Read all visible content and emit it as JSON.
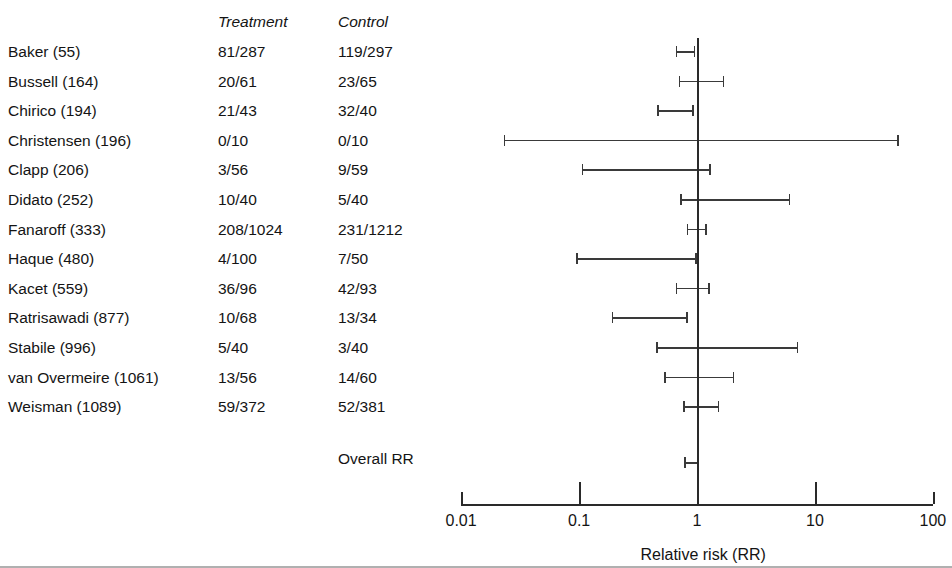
{
  "figure": {
    "type": "forest-plot",
    "x_axis_title": "Relative risk (RR)",
    "overall_label": "Overall RR"
  },
  "table": {
    "headers": {
      "study": "",
      "treatment": "Treatment",
      "control": "Control"
    },
    "rows": [
      {
        "study": "Baker (55)",
        "treatment": "81/287",
        "control": "119/297"
      },
      {
        "study": "Bussell (164)",
        "treatment": "20/61",
        "control": "23/65"
      },
      {
        "study": "Chirico (194)",
        "treatment": "21/43",
        "control": "32/40"
      },
      {
        "study": "Christensen (196)",
        "treatment": "0/10",
        "control": "0/10"
      },
      {
        "study": "Clapp (206)",
        "treatment": "3/56",
        "control": "9/59"
      },
      {
        "study": "Didato (252)",
        "treatment": "10/40",
        "control": "5/40"
      },
      {
        "study": "Fanaroff (333)",
        "treatment": "208/1024",
        "control": "231/1212"
      },
      {
        "study": "Haque (480)",
        "treatment": "4/100",
        "control": "7/50"
      },
      {
        "study": "Kacet (559)",
        "treatment": "36/96",
        "control": "42/93"
      },
      {
        "study": "Ratrisawadi (877)",
        "treatment": "10/68",
        "control": "13/34"
      },
      {
        "study": "Stabile (996)",
        "treatment": "5/40",
        "control": "3/40"
      },
      {
        "study": "van Overmeire (1061)",
        "treatment": "13/56",
        "control": "14/60"
      },
      {
        "study": "Weisman (1089)",
        "treatment": "59/372",
        "control": "52/381"
      }
    ]
  },
  "chart_data": {
    "type": "forest",
    "title": "",
    "xlabel": "Relative risk (RR)",
    "ylabel": "",
    "x_scale": "log10",
    "xlim": [
      0.01,
      100
    ],
    "xticks": [
      0.01,
      0.1,
      1,
      10,
      100
    ],
    "xtick_labels": [
      "0.01",
      "0.1",
      "1",
      "10",
      "100"
    ],
    "null_value": 1,
    "grid": false,
    "legend": "none",
    "studies": [
      {
        "label": "Baker (55)",
        "rr": 0.83,
        "ci_low": 0.66,
        "ci_high": 0.94
      },
      {
        "label": "Bussell (164)",
        "rr": 1.05,
        "ci_low": 0.7,
        "ci_high": 1.65
      },
      {
        "label": "Chirico (194)",
        "rr": 0.65,
        "ci_low": 0.46,
        "ci_high": 0.91
      },
      {
        "label": "Christensen (196)",
        "rr": 1.0,
        "ci_low": 0.023,
        "ci_high": 50.0
      },
      {
        "label": "Clapp (206)",
        "rr": 0.36,
        "ci_low": 0.105,
        "ci_high": 1.27
      },
      {
        "label": "Didato (252)",
        "rr": 2.0,
        "ci_low": 0.72,
        "ci_high": 6.0
      },
      {
        "label": "Fanaroff (333)",
        "rr": 0.99,
        "ci_low": 0.82,
        "ci_high": 1.17
      },
      {
        "label": "Haque (480)",
        "rr": 0.29,
        "ci_low": 0.095,
        "ci_high": 0.97
      },
      {
        "label": "Kacet (559)",
        "rr": 0.9,
        "ci_low": 0.66,
        "ci_high": 1.24
      },
      {
        "label": "Ratrisawadi (877)",
        "rr": 0.38,
        "ci_low": 0.19,
        "ci_high": 0.81
      },
      {
        "label": "Stabile (996)",
        "rr": 1.67,
        "ci_low": 0.45,
        "ci_high": 7.0
      },
      {
        "label": "van Overmeire (1061)",
        "rr": 1.0,
        "ci_low": 0.53,
        "ci_high": 2.0
      },
      {
        "label": "Weisman (1089)",
        "rr": 1.08,
        "ci_low": 0.76,
        "ci_high": 1.5
      }
    ],
    "overall": {
      "label": "Overall RR",
      "rr": 0.88,
      "ci_low": 0.78,
      "ci_high": 1.0
    }
  },
  "geometry": {
    "x_at_001": 461,
    "decade_px": 118,
    "row_top": 55,
    "row_step": 29.6,
    "overall_y": 462,
    "axis_y": 504,
    "null_top": 38,
    "null_bottom": 492
  }
}
